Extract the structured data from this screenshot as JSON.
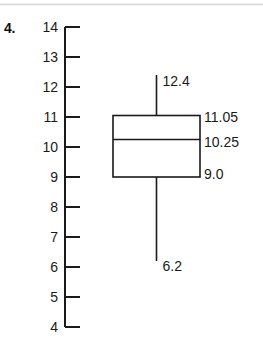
{
  "question": {
    "number": "4."
  },
  "chart_data": {
    "type": "box",
    "title": "",
    "xlabel": "",
    "ylabel": "",
    "ylim": [
      4,
      14
    ],
    "grid": false,
    "legend": "none",
    "axis": {
      "ticks": [
        14,
        13,
        12,
        11,
        10,
        9,
        8,
        7,
        6,
        5,
        4
      ],
      "tick_labels": [
        "14",
        "13",
        "12",
        "11",
        "10",
        "9",
        "8",
        "7",
        "6",
        "5",
        "4"
      ]
    },
    "boxes": [
      {
        "name": "Data set 4",
        "minimum": 6.2,
        "q1": 9.0,
        "median": 10.25,
        "q3": 11.05,
        "maximum": 12.4,
        "labels": {
          "maximum": "12.4",
          "q3": "11.05",
          "median": "10.25",
          "q1": "9.0",
          "minimum": "6.2"
        }
      }
    ]
  },
  "colors": {
    "ink": "#1a1a1a",
    "background": "#ffffff"
  }
}
